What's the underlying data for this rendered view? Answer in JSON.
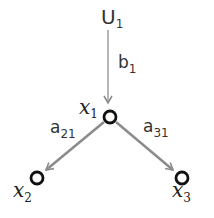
{
  "diagram": {
    "type": "path-diagram",
    "nodes": [
      {
        "id": "u1",
        "label": "U",
        "sub": "1"
      },
      {
        "id": "x1",
        "label": "x",
        "sub": "1"
      },
      {
        "id": "x2",
        "label": "x",
        "sub": "2"
      },
      {
        "id": "x3",
        "label": "x",
        "sub": "3"
      }
    ],
    "edges": [
      {
        "from": "u1",
        "to": "x1",
        "label": "b",
        "sub": "1"
      },
      {
        "from": "x1",
        "to": "x2",
        "label": "a",
        "sub": "21"
      },
      {
        "from": "x1",
        "to": "x3",
        "label": "a",
        "sub": "31"
      }
    ],
    "colors": {
      "edge": "#8c8c8c",
      "node_stroke": "#111111",
      "text": "#333333"
    }
  }
}
